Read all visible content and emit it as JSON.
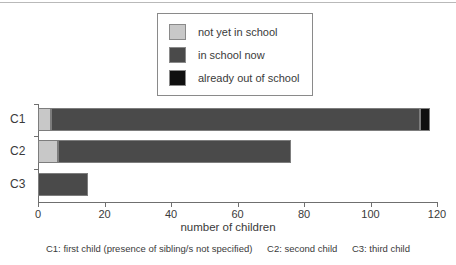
{
  "chart_data": {
    "type": "bar",
    "orientation": "horizontal",
    "stacked": true,
    "title": "",
    "xlabel": "number of children",
    "ylabel": "",
    "xlim": [
      0,
      120
    ],
    "xticks": [
      0,
      20,
      40,
      60,
      80,
      100,
      120
    ],
    "xticklabels": [
      "0",
      "20",
      "40",
      "60",
      "80",
      "100",
      "120"
    ],
    "grid": false,
    "legend_position": "top-center",
    "categories": [
      "C1",
      "C2",
      "C3"
    ],
    "series": [
      {
        "name": "not yet in school",
        "color": "#c8c8c8",
        "values": [
          4,
          6,
          0
        ]
      },
      {
        "name": "in school now",
        "color": "#4a4a4a",
        "values": [
          111,
          70,
          15
        ]
      },
      {
        "name": "already out of school",
        "color": "#101010",
        "values": [
          3,
          0,
          0
        ]
      }
    ],
    "totals": [
      118,
      76,
      15
    ]
  },
  "legend": {
    "items": [
      {
        "label": "not yet in school",
        "color": "#c8c8c8"
      },
      {
        "label": "in school now",
        "color": "#4a4a4a"
      },
      {
        "label": "already out of school",
        "color": "#101010"
      }
    ]
  },
  "axis": {
    "x_title": "number of children",
    "y_labels": [
      "C1",
      "C2",
      "C3"
    ],
    "x_tick_labels": [
      "0",
      "20",
      "40",
      "60",
      "80",
      "100",
      "120"
    ]
  },
  "caption": {
    "c1": "C1: first child (presence of sibling/s not specified)",
    "c2": "C2: second child",
    "c3": "C3: third child"
  }
}
